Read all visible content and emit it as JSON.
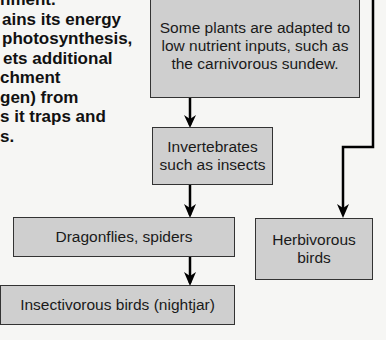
{
  "intro_text": {
    "lines": [
      "nment.",
      "ains its energy",
      "photosynthesis,",
      "ets additional",
      "chment",
      "gen) from",
      "s it traps and",
      "s."
    ]
  },
  "nodes": {
    "sundew": {
      "label": "Some plants are adapted to low nutrient inputs, such as the carnivorous sundew."
    },
    "invertebrates": {
      "label": "Invertebrates such as insects"
    },
    "dragonflies": {
      "label": "Dragonflies, spiders"
    },
    "insectivorous_birds": {
      "label": "Insectivorous birds (nightjar)"
    },
    "herbivorous_birds": {
      "label": "Herbivorous birds"
    }
  },
  "edges": [
    {
      "from": "sundew",
      "to": "invertebrates"
    },
    {
      "from": "invertebrates",
      "to": "dragonflies"
    },
    {
      "from": "dragonflies",
      "to": "insectivorous_birds"
    },
    {
      "from": "top",
      "to": "herbivorous_birds"
    }
  ],
  "colors": {
    "box_fill": "#cfcfcf",
    "box_border": "#333333",
    "arrow": "#000000"
  }
}
